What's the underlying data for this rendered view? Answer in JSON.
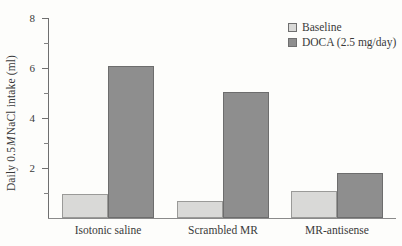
{
  "chart_data": {
    "type": "bar",
    "title": "",
    "xlabel": "",
    "ylabel": "Daily 0.5 M NaCl intake (ml)",
    "ylabel_parts": {
      "pre": "Daily 0.5 ",
      "italic": "M",
      "post": " NaCl intake (ml)"
    },
    "categories": [
      "Isotonic saline",
      "Scrambled MR",
      "MR-antisense"
    ],
    "series": [
      {
        "name": "Baseline",
        "color": "#d9d9d7",
        "values": [
          0.95,
          0.7,
          1.1
        ]
      },
      {
        "name": "DOCA (2.5 mg/day)",
        "color": "#8e8e8e",
        "values": [
          6.1,
          5.05,
          1.8
        ]
      }
    ],
    "ylim": [
      0,
      8
    ],
    "ytick_labels": [
      "8",
      "6",
      "4",
      "2"
    ],
    "ytick_values": [
      8,
      6,
      4,
      2
    ],
    "yticks_minor": [
      1,
      3,
      5,
      7
    ],
    "grid": false,
    "legend_position": "top-right"
  },
  "legend": {
    "items": [
      {
        "label": "Baseline",
        "swatch": "baseline"
      },
      {
        "label": "DOCA (2.5 mg/day)",
        "swatch": "doca"
      }
    ]
  },
  "axis": {
    "y_title_pre": "Daily 0.5 ",
    "y_title_italic": "M",
    "y_title_post": " NaCl intake (ml)",
    "ticks": [
      {
        "label": "8",
        "value": 8
      },
      {
        "label": "6",
        "value": 6
      },
      {
        "label": "4",
        "value": 4
      },
      {
        "label": "2",
        "value": 2
      }
    ]
  }
}
